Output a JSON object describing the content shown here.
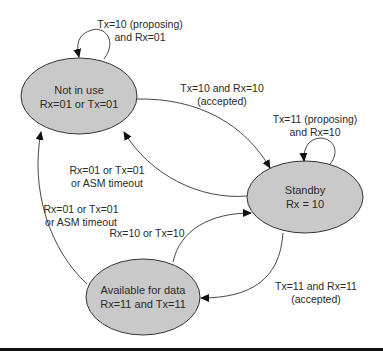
{
  "diagram": {
    "type": "state-machine",
    "colors": {
      "state_fill": "#c9c9c9",
      "stroke": "#333333",
      "text": "#2a2a2a"
    },
    "states": [
      {
        "id": "not_in_use",
        "name": "Not in use",
        "condition": "Rx=01 or Tx=01"
      },
      {
        "id": "standby",
        "name": "Standby",
        "condition": "Rx = 10"
      },
      {
        "id": "available",
        "name": "Available for data",
        "condition": "Rx=11 and Tx=11"
      }
    ],
    "transitions": [
      {
        "from": "not_in_use",
        "to": "not_in_use",
        "line1": "Tx=10 (proposing)",
        "line2": "and Rx=01"
      },
      {
        "from": "not_in_use",
        "to": "standby",
        "line1": "Tx=10 and Rx=10",
        "line2": "(accepted)"
      },
      {
        "from": "standby",
        "to": "standby",
        "line1": "Tx=11 (proposing)",
        "line2": "and Rx=10"
      },
      {
        "from": "standby",
        "to": "not_in_use",
        "line1": "Rx=01 or Tx=01",
        "line2": "or ASM timeout"
      },
      {
        "from": "available",
        "to": "not_in_use",
        "line1": "Rx=01 or Tx=01",
        "line2": "or ASM timeout"
      },
      {
        "from": "available",
        "to": "standby",
        "line1": "Rx=10 or Tx=10",
        "line2": ""
      },
      {
        "from": "standby",
        "to": "available",
        "line1": "Tx=11 and Rx=11",
        "line2": "(accepted)"
      }
    ]
  }
}
